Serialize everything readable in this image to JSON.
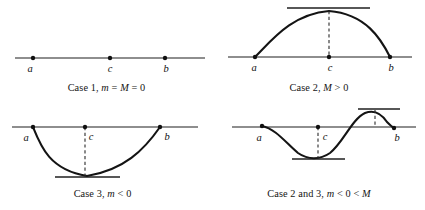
{
  "figure": {
    "background_color": "#ffffff",
    "ink_color": "#141414"
  },
  "panels": [
    {
      "id": "case-1",
      "caption": "Case 1, m = M = 0",
      "caption_parts": {
        "prefix": "Case 1, ",
        "var1": "m",
        "mid": " = ",
        "var2": "M",
        "suffix": " = 0"
      },
      "point_labels": {
        "a": "a",
        "c": "c",
        "b": "b"
      },
      "description": "Flat horizontal line; function identically zero; minimum equals maximum equals zero.",
      "axis": {
        "x_start": 15,
        "x_end": 205,
        "y": 58
      },
      "points": {
        "a_x": 33,
        "c_x": 110,
        "b_x": 165
      },
      "curve_type": "flat"
    },
    {
      "id": "case-2",
      "caption": "Case 2, M > 0",
      "caption_parts": {
        "prefix": "Case 2, ",
        "var1": "M",
        "mid": " > ",
        "var2": "0",
        "suffix": ""
      },
      "point_labels": {
        "a": "a",
        "c": "c",
        "b": "b"
      },
      "description": "Concave arch above the axis; interior maximum at c touching upper tangent line.",
      "axis": {
        "x_start": 228,
        "x_end": 412,
        "y": 57
      },
      "points": {
        "a_x": 255,
        "c_x": 329,
        "b_x": 390
      },
      "tangent": {
        "x_start": 287,
        "x_end": 370,
        "y": 8
      },
      "curve_type": "arch-up"
    },
    {
      "id": "case-3",
      "caption": "Case 3, m < 0",
      "caption_parts": {
        "prefix": "Case 3, ",
        "var1": "m",
        "mid": " < ",
        "var2": "0",
        "suffix": ""
      },
      "point_labels": {
        "a": "a",
        "c": "c",
        "b": "b"
      },
      "description": "Valley below the axis; interior minimum touching lower tangent line.",
      "axis": {
        "x_start": 12,
        "x_end": 198,
        "y": 127
      },
      "points": {
        "a_x": 33,
        "c_x": 85,
        "b_x": 160
      },
      "tangent": {
        "x_start": 55,
        "x_end": 120,
        "y": 177
      },
      "curve_type": "arch-down"
    },
    {
      "id": "case-2-and-3",
      "caption": "Case 2 and 3, m < 0 < M",
      "caption_parts": {
        "prefix": "Case 2 and 3, ",
        "var1": "m",
        "mid": " < 0 < ",
        "var2": "M",
        "suffix": ""
      },
      "point_labels": {
        "a": "a",
        "c": "c",
        "b": "b"
      },
      "description": "Wave dipping to a negative minimum then rising to a positive maximum before b.",
      "axis": {
        "x_start": 232,
        "x_end": 416,
        "y": 127
      },
      "points": {
        "a_x": 262,
        "c_x": 318,
        "b_x": 394
      },
      "tangent_low": {
        "x_start": 292,
        "x_end": 345,
        "y": 159
      },
      "tangent_high": {
        "x_start": 358,
        "x_end": 400,
        "y": 109
      },
      "curve_type": "wave"
    }
  ],
  "geometry_paths": {
    "case2_curve": "M 255 57 C 272 40, 292 14, 329 11 C 366 14, 381 39, 390 57",
    "case3_curve": "M 33 127 C 41 147, 50 170, 87 176 C 124 170, 144 150, 160 127",
    "case4_curve": "M 262 126 C 278 130, 288 144, 300 154 C 310 161, 322 160, 332 152 C 344 141, 352 120, 364 114 C 372 110, 380 112, 386 121 C 389 124, 391 126, 394 128",
    "case2_drop": "M 329 11 L 329 57",
    "case3_drop": "M 85 127 L 85 177",
    "case4_drop_low": "M 318 127 L 318 158",
    "case4_drop_high": "M 375 110 L 375 127"
  }
}
